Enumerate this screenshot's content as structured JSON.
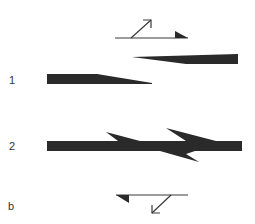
{
  "colors": {
    "ink": "#2a2a2a",
    "line": "#3a3a3a",
    "background": "#ffffff"
  },
  "labels": {
    "row1": "1",
    "row2": "2",
    "panel": "b"
  },
  "symbols": {
    "top": {
      "name": "motion-symbol-upper",
      "description": "horizontal line with filled half-arrowhead on right and diagonal arrow pointing up-right"
    },
    "bottom": {
      "name": "motion-symbol-lower",
      "description": "horizontal line with filled half-arrowhead on left and diagonal arrow pointing down-left"
    }
  },
  "shapes": {
    "stage1": [
      "upper wedge tapering left",
      "lower wedge tapering right"
    ],
    "stage2": [
      "merged bar with two upper barbs and one lower barb"
    ]
  }
}
